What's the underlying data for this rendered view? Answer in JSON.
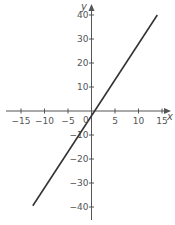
{
  "chart_data": {
    "type": "line",
    "title": "",
    "xlabel": "x",
    "ylabel": "y",
    "xlim": [
      -16,
      16
    ],
    "ylim": [
      -45,
      44
    ],
    "grid": false,
    "legend": null,
    "x_ticks": [
      -15,
      -10,
      -5,
      5,
      10,
      15
    ],
    "x_tick_labels": [
      "−15",
      "−10",
      "−5",
      "5",
      "10",
      "15"
    ],
    "y_ticks": [
      40,
      30,
      20,
      10,
      -10,
      -20,
      -30,
      -40
    ],
    "y_tick_labels": [
      "40",
      "30",
      "20",
      "10",
      "−10",
      "−20",
      "−30",
      "−40"
    ],
    "origin_label": "0",
    "series": [
      {
        "name": "y = 3x − 2",
        "equation": "y = 3x - 2",
        "x": [
          -12.5,
          14
        ],
        "y": [
          -39.5,
          40
        ],
        "color": "#333333"
      }
    ]
  }
}
